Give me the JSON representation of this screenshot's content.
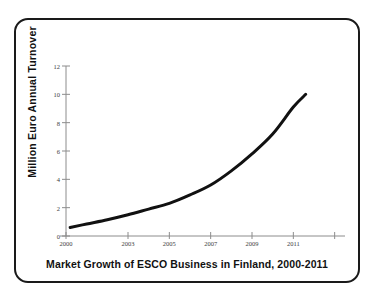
{
  "figure": {
    "caption": "Market Growth of ESCO Business in Finland, 2000-2011",
    "border_color": "#1a1a1a",
    "background_color": "#ffffff"
  },
  "chart_data": {
    "type": "line",
    "title": "",
    "caption": "Market Growth of ESCO Business in Finland, 2000-2011",
    "xlabel": "",
    "ylabel": "Million Euro Annual Turnover",
    "xlim": [
      2000,
      2012
    ],
    "ylim": [
      0,
      12
    ],
    "grid": false,
    "legend": null,
    "line_color": "#111111",
    "line_width": 3,
    "axis_color": "#8c8c8c",
    "y_ticks": [
      0,
      2,
      4,
      6,
      8,
      10,
      12
    ],
    "y_tick_labels": [
      "0",
      "2",
      "4",
      "6",
      "8",
      "10",
      "12"
    ],
    "x_ticks": [
      2000,
      2003,
      2005,
      2007,
      2009,
      2011
    ],
    "x_tick_labels": [
      "2000",
      "2003",
      "2005",
      "2007",
      "2009",
      "2011"
    ],
    "x_unlabeled_ticks": [
      2013
    ],
    "x": [
      2000.2,
      2001,
      2002,
      2003,
      2004,
      2005,
      2006,
      2007,
      2008,
      2009,
      2010,
      2011,
      2011.6
    ],
    "values": [
      0.6,
      0.85,
      1.15,
      1.5,
      1.9,
      2.3,
      2.9,
      3.6,
      4.6,
      5.8,
      7.2,
      9.1,
      10.0
    ],
    "series": [
      {
        "name": "Annual Turnover",
        "values": [
          0.6,
          0.85,
          1.15,
          1.5,
          1.9,
          2.3,
          2.9,
          3.6,
          4.6,
          5.8,
          7.2,
          9.1,
          10.0
        ]
      }
    ]
  },
  "plot_geometry": {
    "x_pixel_left": 66,
    "x_pixel_right": 345,
    "y_pixel_bottom": 236,
    "y_pixel_top": 66,
    "x_value_left": 2000,
    "x_value_right": 2013.5,
    "y_value_bottom": 0,
    "y_value_top": 12
  }
}
